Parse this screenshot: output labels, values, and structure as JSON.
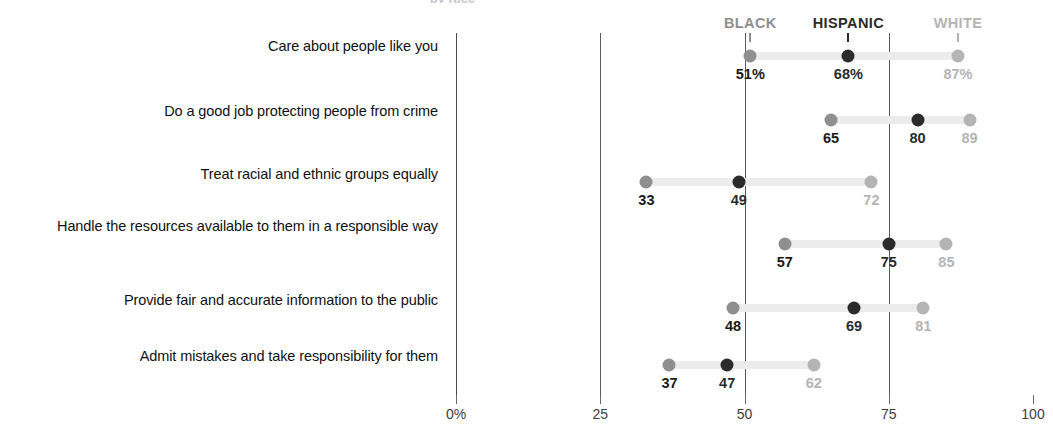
{
  "title_sliver": "by race",
  "chart_data": {
    "type": "scatter",
    "subtype": "dot-plot",
    "title": "",
    "xlabel": "",
    "ylabel": "",
    "xlim": [
      0,
      100
    ],
    "xticks": [
      {
        "value": 0,
        "label": "0%"
      },
      {
        "value": 25,
        "label": "25"
      },
      {
        "value": 50,
        "label": "50"
      },
      {
        "value": 75,
        "label": "75"
      },
      {
        "value": 100,
        "label": "100"
      }
    ],
    "gridlines": [
      25,
      50,
      75
    ],
    "grid": true,
    "legend_position": "top",
    "series": [
      {
        "name": "BLACK",
        "color": "#8f8f8f",
        "header_x": 51,
        "values": [
          51,
          65,
          33,
          57,
          48,
          37
        ],
        "labels": [
          "51%",
          "65",
          "33",
          "57",
          "48",
          "37"
        ]
      },
      {
        "name": "HISPANIC",
        "color": "#2b2b2b",
        "header_x": 68,
        "values": [
          68,
          80,
          49,
          75,
          69,
          47
        ],
        "labels": [
          "68%",
          "80",
          "49",
          "75",
          "69",
          "47"
        ]
      },
      {
        "name": "WHITE",
        "color": "#b4b4b4",
        "header_x": 87,
        "values": [
          87,
          89,
          72,
          85,
          81,
          62
        ],
        "labels": [
          "87%",
          "89",
          "72",
          "85",
          "81",
          "62"
        ]
      }
    ],
    "categories": [
      "Care about people like you",
      "Do a good job protecting people from crime",
      "Treat racial and ethnic groups equally",
      "Handle the resources available to them in a responsible way",
      "Provide fair and accurate information to the public",
      "Admit mistakes and take responsibility for them"
    ]
  },
  "layout": {
    "row_y": [
      56,
      120,
      182,
      244,
      308,
      365
    ],
    "label_y": [
      38,
      103,
      166,
      218,
      292,
      348
    ],
    "axis_x0": 456,
    "axis_x100": 1033
  }
}
